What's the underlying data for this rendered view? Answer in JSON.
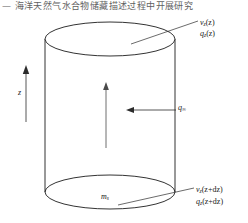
{
  "header": {
    "text": "—  海洋天然气水合物储藏描述过程中开展研究"
  },
  "diagram": {
    "shape": "cylinder",
    "stroke_color": "#1c1c1c",
    "fill_color": "#ffffff",
    "labels": {
      "velocity_top": "v",
      "velocity_top_sub": "z",
      "velocity_top_arg": "(z)",
      "flux_top": "q",
      "flux_top_sub": "z",
      "flux_top_arg": "(z)",
      "velocity_bottom": "v",
      "velocity_bottom_sub": "z",
      "velocity_bottom_arg": "(z+dz)",
      "flux_bottom": "q",
      "flux_bottom_sub": "z",
      "flux_bottom_arg": "(z+dz)",
      "lateral_flux": "q",
      "lateral_flux_sub": "∞",
      "mass_source": "m",
      "mass_source_sub": "s",
      "axis": "z"
    }
  }
}
